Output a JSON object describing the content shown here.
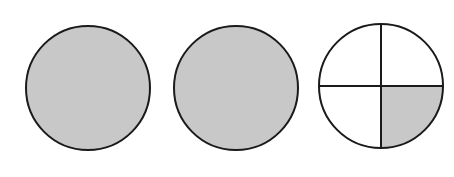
{
  "diagram": {
    "fraction_represented": "2 1/4",
    "colors": {
      "shade": "#c8c8c8",
      "stroke": "#1a1a1a",
      "background": "#ffffff"
    },
    "circles": [
      {
        "id": "whole-1",
        "cx": 88,
        "cy": 88,
        "r": 62,
        "parts": 1,
        "shaded_parts": 1
      },
      {
        "id": "whole-2",
        "cx": 236,
        "cy": 88,
        "r": 62,
        "parts": 1,
        "shaded_parts": 1
      },
      {
        "id": "quartered",
        "cx": 381,
        "cy": 86,
        "r": 62,
        "parts": 4,
        "shaded_parts": 1,
        "shaded_quadrant": "bottom-right"
      }
    ]
  }
}
